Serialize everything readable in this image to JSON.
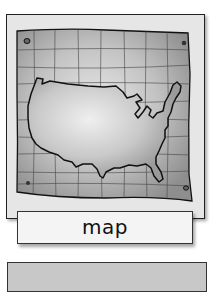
{
  "card": {
    "icon": "us-map-icon",
    "label": "map"
  },
  "next_card": {
    "label": ""
  },
  "colors": {
    "frame_bg": "#e6e6e6",
    "paper": "#b8b8b8",
    "outline": "#111111",
    "label_bg": "#f4f4f4",
    "next_card_bg": "#c8c8c8"
  }
}
